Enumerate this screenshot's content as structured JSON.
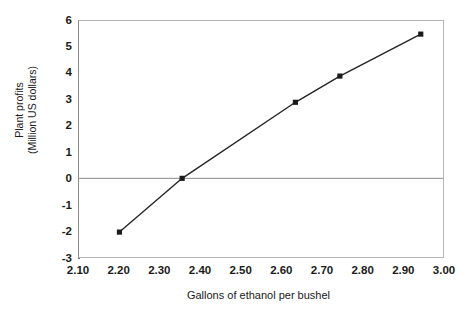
{
  "chart_data": {
    "type": "line",
    "title": "",
    "xlabel": "Gallons of ethanol per bushel",
    "ylabel": "Plant profits\n(Million US dollars)",
    "ylabel_line1": "Plant profits",
    "ylabel_line2": "(Million US dollars)",
    "xlim": [
      2.1,
      3.0
    ],
    "ylim": [
      -3,
      6
    ],
    "xticks": [
      2.1,
      2.2,
      2.3,
      2.4,
      2.5,
      2.6,
      2.7,
      2.8,
      2.9,
      3.0
    ],
    "xtick_labels": [
      "2.10",
      "2.20",
      "2.30",
      "2.40",
      "2.50",
      "2.60",
      "2.70",
      "2.80",
      "2.90",
      "3.00"
    ],
    "yticks": [
      6,
      5,
      4,
      3,
      2,
      1,
      0,
      -1,
      -2,
      -3
    ],
    "ytick_labels": [
      "6",
      "5",
      "4",
      "3",
      "2",
      "1",
      "0",
      "-1",
      "-2",
      "-3"
    ],
    "grid": false,
    "legend": false,
    "zero_line": true,
    "marker": "square",
    "line_color": "#242424",
    "marker_color": "#1b1b1b",
    "zero_line_color": "#8a8a8a",
    "frame_color": "#b5b5b5",
    "background": "#ffffff",
    "series": [
      {
        "name": "Plant profits",
        "x": [
          2.2,
          2.355,
          2.635,
          2.745,
          2.945
        ],
        "values": [
          -2.05,
          0.0,
          2.9,
          3.9,
          5.5
        ]
      }
    ]
  }
}
